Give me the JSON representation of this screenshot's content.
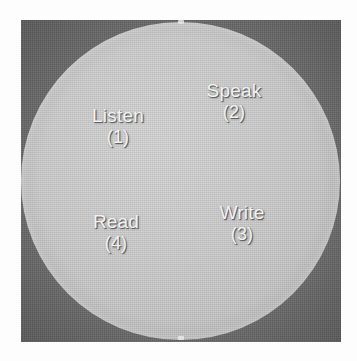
{
  "figure": {
    "shape": "circle",
    "background_color": "#6c6c6c",
    "circle_color": "#c6c6c6",
    "label_color": "#f2f2f2",
    "quadrants": [
      {
        "label": "Listen",
        "index": "(1)",
        "position": "upper-left"
      },
      {
        "label": "Speak",
        "index": "(2)",
        "position": "upper-right"
      },
      {
        "label": "Write",
        "index": "(3)",
        "position": "lower-right"
      },
      {
        "label": "Read",
        "index": "(4)",
        "position": "lower-left"
      }
    ]
  }
}
